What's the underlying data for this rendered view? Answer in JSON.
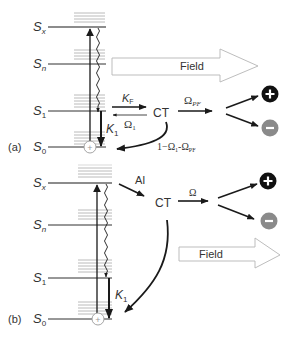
{
  "panel_a": {
    "label": "(a)",
    "levels": [
      {
        "name": "S",
        "sub": "x",
        "y": 27
      },
      {
        "name": "S",
        "sub": "n",
        "y": 64
      },
      {
        "name": "S",
        "sub": "1",
        "y": 111
      },
      {
        "name": "S",
        "sub": "0",
        "y": 147
      }
    ],
    "field_label": "Field",
    "kf_label": "K",
    "kf_sub": "F",
    "omega1_label": "Ω",
    "omega1_sub": "1",
    "k1_label": "K",
    "k1_sub": "1",
    "ct_label": "CT",
    "omega_pf_label": "Ω",
    "omega_pf_sub": "PF",
    "return_label_prefix": "1−Ω",
    "return_label_sub1": "1",
    "return_label_mid": "-Ω",
    "return_label_sub2": "PF",
    "plus_symbol": "+",
    "minus_symbol": "−",
    "ground_marker": "+"
  },
  "panel_b": {
    "label": "(b)",
    "levels": [
      {
        "name": "S",
        "sub": "x",
        "y": 183
      },
      {
        "name": "S",
        "sub": "n",
        "y": 225
      },
      {
        "name": "S",
        "sub": "1",
        "y": 278
      },
      {
        "name": "S",
        "sub": "0",
        "y": 319
      }
    ],
    "field_label": "Field",
    "ai_label": "AI",
    "ct_label": "CT",
    "omega_label": "Ω",
    "k1_label": "K",
    "k1_sub": "1",
    "plus_symbol": "+",
    "minus_symbol": "−",
    "ground_marker": "+"
  },
  "colors": {
    "line": "#1a1a1a",
    "vib_level": "#9a9a9a",
    "field_outline": "#b0b0b0",
    "positive_charge": "#111111",
    "negative_charge": "#8a8a8a",
    "text": "#333333"
  }
}
